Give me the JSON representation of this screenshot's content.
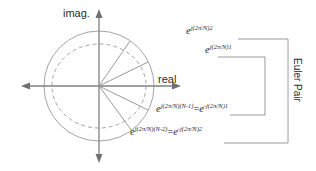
{
  "figure": {
    "background_color": "#ffffff",
    "stroke_color": "#8a8a8a",
    "text_color": "#2b2b2b"
  },
  "axes": {
    "imaginary_label": "imag.",
    "real_label": "real",
    "imag_axis_name": "imaginary-axis",
    "real_axis_name": "real-axis"
  },
  "unit_circle": {
    "center_x": 99,
    "center_y": 86,
    "radius": 55,
    "style": "solid"
  },
  "dashed_ellipse": {
    "center_x": 99,
    "center_y": 86,
    "radius_x": 47,
    "radius_y": 42,
    "style": "dashed"
  },
  "vectors": [
    {
      "name": "vector-pos2",
      "label_key": "pos2",
      "end_x": 130,
      "end_y": 41
    },
    {
      "name": "vector-pos1",
      "label_key": "pos1",
      "end_x": 148,
      "end_y": 62
    },
    {
      "name": "vector-real",
      "label_key": "real",
      "end_x": 154,
      "end_y": 86
    },
    {
      "name": "vector-neg1",
      "label_key": "neg1",
      "end_x": 148,
      "end_y": 110
    },
    {
      "name": "vector-neg2",
      "label_key": "neg2",
      "end_x": 132,
      "end_y": 131
    }
  ],
  "expressions": {
    "pos2": {
      "base": "e",
      "exponent": "j(2π/N)2",
      "plain": "e^{j(2π/N)2}"
    },
    "pos1": {
      "base": "e",
      "exponent": "j(2π/N)1",
      "plain": "e^{j(2π/N)1}"
    },
    "neg1": {
      "base": "e",
      "exponent": "j(2π/N)(N-1)",
      "equals": "=",
      "base2": "e",
      "exponent2": "-j(2π/N)1",
      "plain": "e^{j(2π/N)(N-1)}=e^{-j(2π/N)1}"
    },
    "neg2": {
      "base": "e",
      "exponent": "j(2π/N)(N-2)",
      "equals": "=",
      "base2": "e",
      "exponent2": "-j(2π/N)2",
      "plain": "e^{j(2π/N)(N-2)}=e^{-j(2π/N)2}"
    }
  },
  "annotations": {
    "euler_pair_label": "Euler Pair",
    "outer_bracket": {
      "name": "euler-pair-bracket-outer",
      "top_y": 39,
      "bottom_y": 143,
      "right_x": 288,
      "left_x_top": 238,
      "left_x_bottom": 224
    },
    "inner_bracket": {
      "name": "euler-pair-bracket-inner",
      "top_y": 57,
      "bottom_y": 115,
      "right_x": 265,
      "left_x_top": 218,
      "left_x_bottom": 230
    }
  }
}
